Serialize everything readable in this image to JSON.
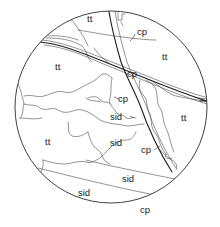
{
  "figure": {
    "type": "thin-section mineral map",
    "field_of_view": {
      "shape": "circle",
      "cx": 111,
      "cy": 107,
      "r": 96
    },
    "colors": {
      "line": "#2a2a2a",
      "background": "#ffffff",
      "text": "#222222"
    },
    "labels": [
      {
        "id": "tt-1",
        "text": "tt",
        "x": 87,
        "y": 22
      },
      {
        "id": "tt-2",
        "text": "tt",
        "x": 55,
        "y": 70
      },
      {
        "id": "tt-3",
        "text": "tt",
        "x": 162,
        "y": 60
      },
      {
        "id": "tt-4",
        "text": "tt",
        "x": 181,
        "y": 121
      },
      {
        "id": "tt-5",
        "text": "tt",
        "x": 45,
        "y": 145
      },
      {
        "id": "cp-1",
        "text": "cp",
        "x": 140,
        "y": 35
      },
      {
        "id": "cp-2",
        "text": "cp",
        "x": 131,
        "y": 77
      },
      {
        "id": "cp-3",
        "text": "cp",
        "x": 122,
        "y": 102
      },
      {
        "id": "cp-4",
        "text": "cp",
        "x": 147,
        "y": 153
      },
      {
        "id": "cp-5",
        "text": "cp",
        "x": 145,
        "y": 213
      },
      {
        "id": "sid-1",
        "text": "sid",
        "x": 116,
        "y": 119
      },
      {
        "id": "sid-2",
        "text": "sid",
        "x": 116,
        "y": 145
      },
      {
        "id": "sid-3",
        "text": "sid",
        "x": 130,
        "y": 181
      },
      {
        "id": "sid-4",
        "text": "sid",
        "x": 86,
        "y": 196
      }
    ],
    "legend_terms": [
      "tt",
      "cp",
      "sid"
    ]
  }
}
